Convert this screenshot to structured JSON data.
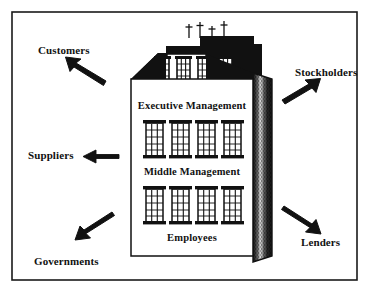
{
  "figure": {
    "border_color": "#1a1a1a",
    "background_color": "#ffffff",
    "ink_color": "#111111"
  },
  "building": {
    "name": "corporate-building",
    "facade_color": "#ffffff",
    "roof_color": "#111111",
    "side_wall_color": "#2b2b2b",
    "outline_color": "#111111",
    "antenna_count": 4,
    "floors": [
      {
        "id": "executive",
        "label": "Executive Management",
        "window_count": 4
      },
      {
        "id": "middle",
        "label": "Middle Management",
        "window_count": 4
      },
      {
        "id": "employees",
        "label": "Employees",
        "window_count": 4
      }
    ]
  },
  "stakeholders": [
    {
      "id": "customers",
      "label": "Customers",
      "arrow_direction": "up-left"
    },
    {
      "id": "stockholders",
      "label": "Stockholders",
      "arrow_direction": "up-right"
    },
    {
      "id": "suppliers",
      "label": "Suppliers",
      "arrow_direction": "left"
    },
    {
      "id": "lenders",
      "label": "Lenders",
      "arrow_direction": "down-right"
    },
    {
      "id": "governments",
      "label": "Governments",
      "arrow_direction": "down-left"
    }
  ]
}
